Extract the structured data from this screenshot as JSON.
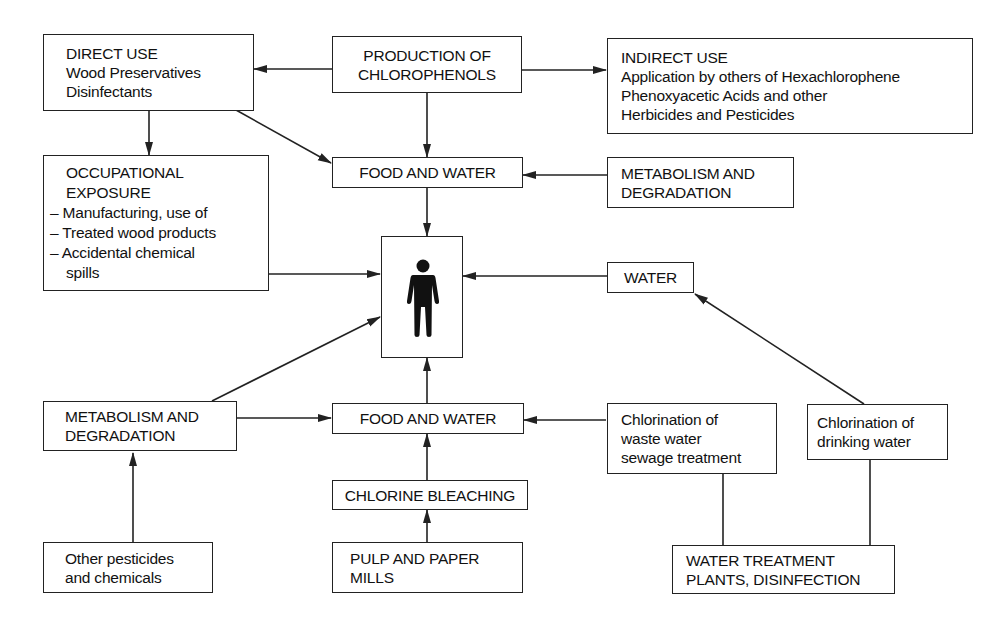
{
  "nodes": {
    "direct_use": {
      "heading": "DIRECT USE",
      "lines": [
        "Wood Preservatives",
        "Disinfectants"
      ]
    },
    "production": {
      "lines": [
        "PRODUCTION OF",
        "CHLOROPHENOLS"
      ]
    },
    "indirect_use": {
      "heading": "INDIRECT USE",
      "lines": [
        "Application by others of Hexachlorophene",
        "Phenoxyacetic Acids and other",
        "Herbicides and Pesticides"
      ]
    },
    "occupational": {
      "heading_lines": [
        "OCCUPATIONAL",
        "EXPOSURE"
      ],
      "items": [
        "– Manufacturing, use of",
        "– Treated wood products",
        "– Accidental chemical",
        "spills"
      ]
    },
    "food_water_top": {
      "lines": [
        "FOOD AND WATER"
      ]
    },
    "metabolism_top": {
      "lines": [
        "METABOLISM AND",
        "DEGRADATION"
      ]
    },
    "human": {
      "icon": "person-icon"
    },
    "water": {
      "lines": [
        "WATER"
      ]
    },
    "metabolism_bottom": {
      "lines": [
        "METABOLISM AND",
        "DEGRADATION"
      ]
    },
    "food_water_bottom": {
      "lines": [
        "FOOD AND WATER"
      ]
    },
    "chlorination_waste": {
      "lines": [
        "Chlorination of",
        "waste water",
        "sewage treatment"
      ]
    },
    "chlorination_drinking": {
      "lines": [
        "Chlorination of",
        "drinking water"
      ]
    },
    "chlorine_bleaching": {
      "lines": [
        "CHLORINE BLEACHING"
      ]
    },
    "other_pesticides": {
      "lines": [
        "Other pesticides",
        "and chemicals"
      ]
    },
    "pulp_paper": {
      "lines": [
        "PULP AND PAPER",
        "MILLS"
      ]
    },
    "water_treatment": {
      "lines": [
        "WATER TREATMENT",
        "PLANTS, DISINFECTION"
      ]
    }
  },
  "edges": [
    {
      "from": "production",
      "to": "direct_use",
      "arrow": true
    },
    {
      "from": "production",
      "to": "indirect_use",
      "arrow": true
    },
    {
      "from": "production",
      "to": "food_water_top",
      "arrow": true
    },
    {
      "from": "direct_use",
      "to": "occupational",
      "arrow": true
    },
    {
      "from": "direct_use",
      "to": "food_water_top",
      "arrow": true
    },
    {
      "from": "metabolism_top",
      "to": "food_water_top",
      "arrow": true
    },
    {
      "from": "food_water_top",
      "to": "human",
      "arrow": true
    },
    {
      "from": "occupational",
      "to": "human",
      "arrow": true
    },
    {
      "from": "water",
      "to": "human",
      "arrow": true
    },
    {
      "from": "metabolism_bottom",
      "to": "human",
      "arrow": true
    },
    {
      "from": "food_water_bottom",
      "to": "human",
      "arrow": true
    },
    {
      "from": "metabolism_bottom",
      "to": "food_water_bottom",
      "arrow": true
    },
    {
      "from": "chlorination_waste",
      "to": "food_water_bottom",
      "arrow": true
    },
    {
      "from": "chlorination_drinking",
      "to": "water",
      "arrow": true
    },
    {
      "from": "chlorine_bleaching",
      "to": "food_water_bottom",
      "arrow": true
    },
    {
      "from": "pulp_paper",
      "to": "chlorine_bleaching",
      "arrow": true
    },
    {
      "from": "other_pesticides",
      "to": "metabolism_bottom",
      "arrow": true
    },
    {
      "from": "water_treatment",
      "to": "chlorination_waste",
      "arrow": false
    },
    {
      "from": "water_treatment",
      "to": "chlorination_drinking",
      "arrow": false
    }
  ],
  "colors": {
    "stroke": "#222222",
    "background": "#ffffff",
    "text": "#111111"
  }
}
